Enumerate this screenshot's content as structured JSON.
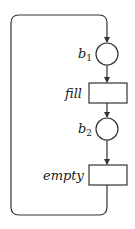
{
  "diagram": {
    "type": "petri-net",
    "places": [
      {
        "id": "b1",
        "label": "b",
        "subscript": "1"
      },
      {
        "id": "b2",
        "label": "b",
        "subscript": "2"
      }
    ],
    "transitions": [
      {
        "id": "fill",
        "label": "fill"
      },
      {
        "id": "empty",
        "label": "empty"
      }
    ],
    "arcs": [
      {
        "from": "empty",
        "to": "b1",
        "route": "loop-back"
      },
      {
        "from": "b1",
        "to": "fill"
      },
      {
        "from": "fill",
        "to": "b2"
      },
      {
        "from": "b2",
        "to": "empty"
      }
    ],
    "colors": {
      "stroke": "#333333",
      "text": "#1a1a1a",
      "background": "#ffffff"
    }
  }
}
